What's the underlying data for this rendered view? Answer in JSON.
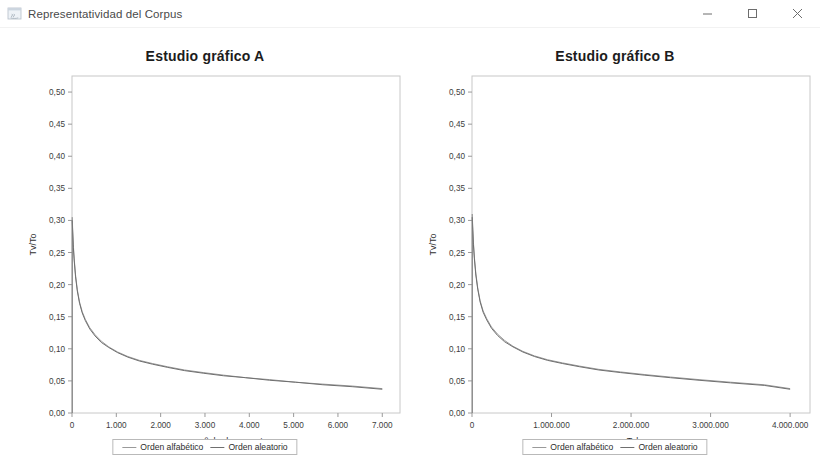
{
  "window": {
    "title": "Representatividad del Corpus",
    "icon": "java-app-icon",
    "controls": {
      "minimize": "Minimizar",
      "maximize": "Maximizar",
      "close": "Cerrar"
    }
  },
  "legend_shared": {
    "series_a_label": "Orden alfabético",
    "series_b_label": "Orden aleatorio",
    "series_a_color": "#9a9a9a",
    "series_b_color": "#6f6f6f"
  },
  "chart_data": [
    {
      "type": "line",
      "panel": "A",
      "title": "Estudio gráfico A",
      "xlabel": "nº de documentos",
      "ylabel": "Tv/To",
      "xlim": [
        0,
        7400
      ],
      "ylim": [
        0,
        0.525
      ],
      "grid": false,
      "legend_position": "bottom",
      "xticks": [
        0,
        1000,
        2000,
        3000,
        4000,
        5000,
        6000,
        7000
      ],
      "xticklabels": [
        "0",
        "1.000",
        "2.000",
        "3.000",
        "4.000",
        "5.000",
        "6.000",
        "7.000"
      ],
      "yticks": [
        0.0,
        0.05,
        0.1,
        0.15,
        0.2,
        0.25,
        0.3,
        0.35,
        0.4,
        0.45,
        0.5
      ],
      "yticklabels": [
        "0,00",
        "0,05",
        "0,10",
        "0,15",
        "0,20",
        "0,25",
        "0,30",
        "0,35",
        "0,40",
        "0,45",
        "0,50"
      ],
      "series": [
        {
          "name": "Orden alfabético",
          "color": "#9a9a9a",
          "x": [
            5,
            15,
            30,
            50,
            80,
            120,
            170,
            230,
            300,
            400,
            520,
            660,
            830,
            1030,
            1260,
            1520,
            1820,
            2160,
            2540,
            2960,
            3420,
            3920,
            4460,
            5040,
            5660,
            6320,
            7000
          ],
          "y": [
            0.305,
            0.286,
            0.262,
            0.24,
            0.215,
            0.192,
            0.173,
            0.158,
            0.146,
            0.133,
            0.122,
            0.112,
            0.103,
            0.095,
            0.088,
            0.082,
            0.077,
            0.072,
            0.067,
            0.063,
            0.059,
            0.055,
            0.052,
            0.048,
            0.045,
            0.042,
            0.038
          ]
        },
        {
          "name": "Orden aleatorio",
          "color": "#6f6f6f",
          "x": [
            5,
            15,
            30,
            50,
            80,
            120,
            170,
            230,
            300,
            400,
            520,
            660,
            830,
            1030,
            1260,
            1520,
            1820,
            2160,
            2540,
            2960,
            3420,
            3920,
            4460,
            5040,
            5660,
            6320,
            7000
          ],
          "y": [
            0.3,
            0.282,
            0.258,
            0.237,
            0.212,
            0.19,
            0.171,
            0.156,
            0.144,
            0.131,
            0.12,
            0.11,
            0.102,
            0.094,
            0.087,
            0.081,
            0.076,
            0.071,
            0.066,
            0.062,
            0.058,
            0.055,
            0.051,
            0.048,
            0.044,
            0.041,
            0.037
          ]
        }
      ]
    },
    {
      "type": "line",
      "panel": "B",
      "title": "Estudio gráfico B",
      "xlabel": "Tokens",
      "ylabel": "Tv/To",
      "xlim": [
        0,
        4250000
      ],
      "ylim": [
        0,
        0.525
      ],
      "grid": false,
      "legend_position": "bottom",
      "xticks": [
        0,
        1000000,
        2000000,
        3000000,
        4000000
      ],
      "xticklabels": [
        "0",
        "1.000.000",
        "2.000.000",
        "3.000.000",
        "4.000.000"
      ],
      "yticks": [
        0.0,
        0.05,
        0.1,
        0.15,
        0.2,
        0.25,
        0.3,
        0.35,
        0.4,
        0.45,
        0.5
      ],
      "yticklabels": [
        "0,00",
        "0,05",
        "0,10",
        "0,15",
        "0,20",
        "0,25",
        "0,30",
        "0,35",
        "0,40",
        "0,45",
        "0,50"
      ],
      "series": [
        {
          "name": "Orden alfabético",
          "color": "#9a9a9a",
          "x": [
            3000,
            9000,
            18000,
            30000,
            48000,
            72000,
            102000,
            140000,
            185000,
            245000,
            320000,
            410000,
            515000,
            640000,
            785000,
            950000,
            1140000,
            1355000,
            1595000,
            1865000,
            2165000,
            2495000,
            2855000,
            3250000,
            3675000,
            4000000
          ],
          "y": [
            0.31,
            0.29,
            0.266,
            0.243,
            0.218,
            0.195,
            0.175,
            0.159,
            0.147,
            0.134,
            0.123,
            0.113,
            0.104,
            0.096,
            0.089,
            0.083,
            0.078,
            0.073,
            0.068,
            0.064,
            0.06,
            0.056,
            0.052,
            0.048,
            0.044,
            0.038
          ]
        },
        {
          "name": "Orden aleatorio",
          "color": "#6f6f6f",
          "x": [
            3000,
            9000,
            18000,
            30000,
            48000,
            72000,
            102000,
            140000,
            185000,
            245000,
            320000,
            410000,
            515000,
            640000,
            785000,
            950000,
            1140000,
            1355000,
            1595000,
            1865000,
            2165000,
            2495000,
            2855000,
            3250000,
            3675000,
            4000000
          ],
          "y": [
            0.305,
            0.286,
            0.262,
            0.24,
            0.215,
            0.193,
            0.173,
            0.157,
            0.145,
            0.132,
            0.121,
            0.111,
            0.103,
            0.095,
            0.088,
            0.082,
            0.077,
            0.072,
            0.067,
            0.063,
            0.059,
            0.055,
            0.051,
            0.047,
            0.043,
            0.037
          ]
        }
      ]
    }
  ]
}
